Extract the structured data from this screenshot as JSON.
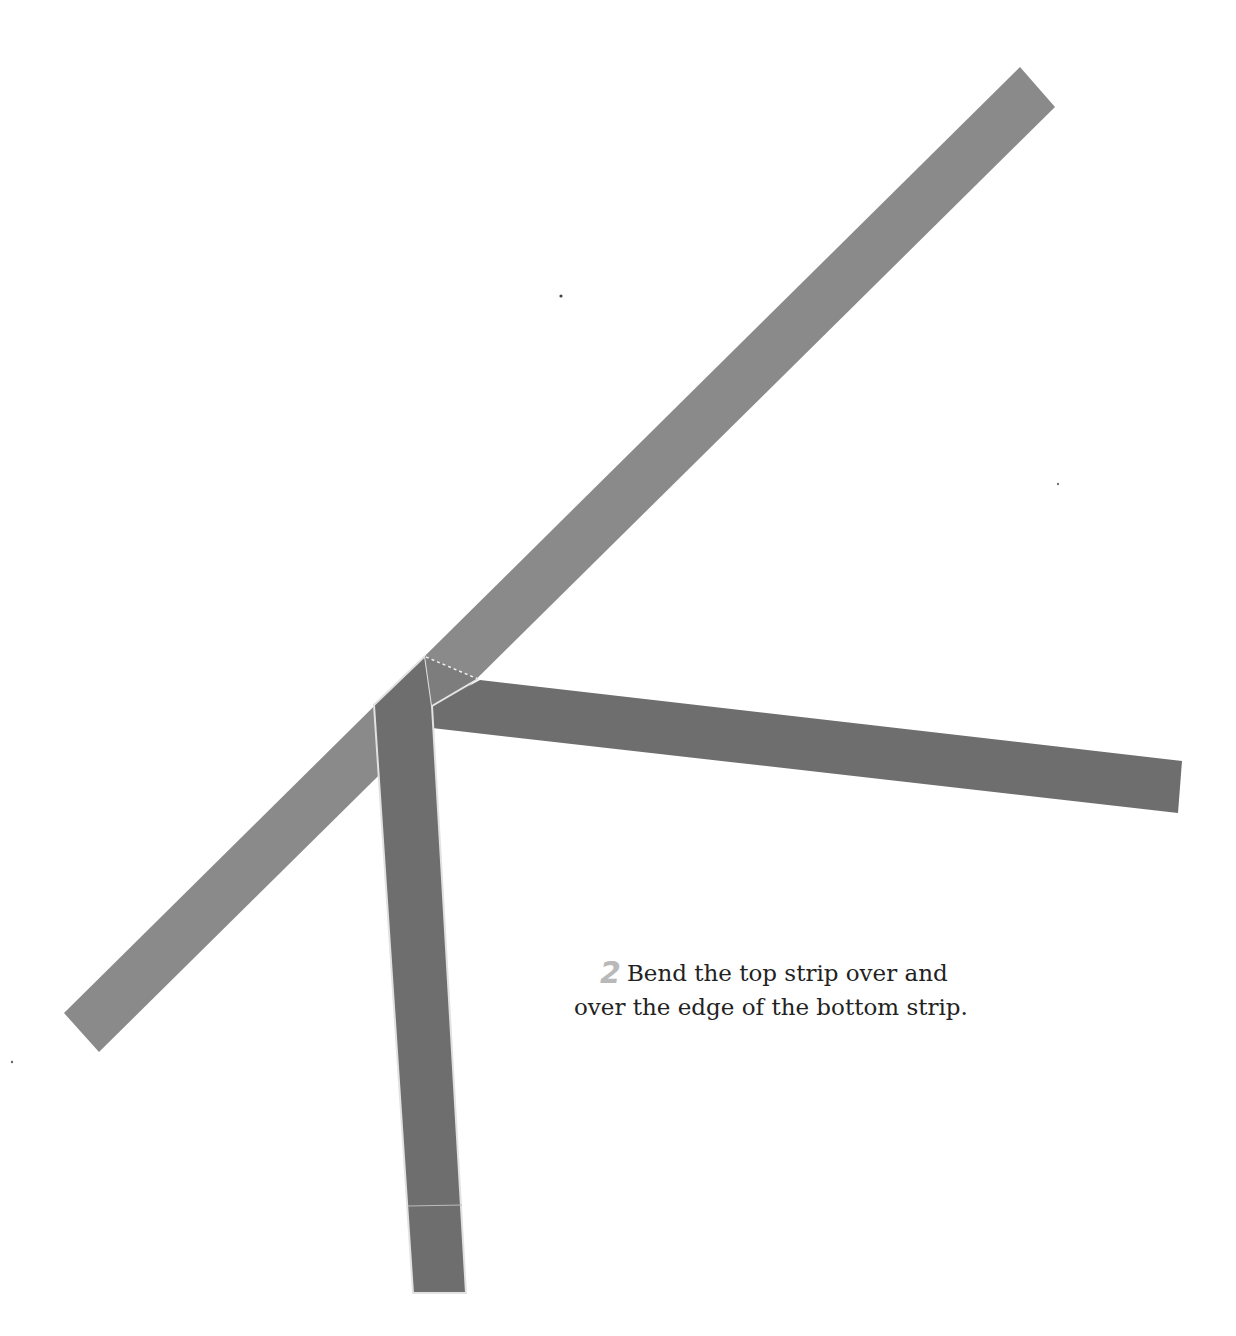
{
  "instruction": {
    "step_number": "2",
    "line1": "Bend the top strip over and",
    "line2": "over the edge of the bottom strip."
  },
  "colors": {
    "diagonal_strip": "#8a8a8a",
    "dark_strip": "#6e6e6e",
    "fold_face": "#7d7d7d",
    "crease_line": "#e6e6e6",
    "step_number": "#b9b9b9",
    "text": "#222222"
  },
  "shapes": {
    "diagonal_strip": "1020,67 1055,107 99,1052 64,1013",
    "vertical_strip": "374,705 425,656 432,706 466,1293 413,1293",
    "right_strip": "480,680 1182,761 1178,813 432,728 432,706",
    "fold_triangle": "425,656 478,679 432,706",
    "dashed_fold_line": "426,657 478,679",
    "crease_edge": "478,679 432,706",
    "bottom_crease": "408,1206 462,1205"
  }
}
